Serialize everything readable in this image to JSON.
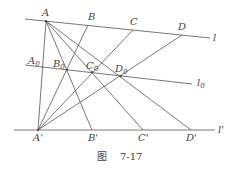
{
  "figure": {
    "caption_prefix": "图",
    "caption_number": "7-17",
    "lines": {
      "l": {
        "label": "l",
        "x1": 25,
        "y1": 19,
        "x2": 210,
        "y2": 38
      },
      "l0": {
        "label": "l",
        "sub": "0",
        "x1": 25,
        "y1": 65,
        "x2": 192,
        "y2": 84
      },
      "lp": {
        "label": "l'",
        "x1": 14,
        "y1": 130,
        "x2": 215,
        "y2": 130
      }
    },
    "points": {
      "A": {
        "label": "A",
        "sub": "",
        "x": 46,
        "y": 21
      },
      "B": {
        "label": "B",
        "sub": "",
        "x": 88,
        "y": 25
      },
      "C": {
        "label": "C",
        "sub": "",
        "x": 133,
        "y": 30
      },
      "D": {
        "label": "D",
        "sub": "",
        "x": 182,
        "y": 35
      },
      "A0": {
        "label": "A",
        "sub": "0",
        "x": 41,
        "y": 67
      },
      "B0": {
        "label": "B",
        "sub": "0",
        "x": 67,
        "y": 70
      },
      "C0": {
        "label": "C",
        "sub": "0",
        "x": 92,
        "y": 72
      },
      "D0": {
        "label": "D",
        "sub": "0",
        "x": 121,
        "y": 76
      },
      "Ap": {
        "label": "A'",
        "sub": "",
        "x": 38,
        "y": 130
      },
      "Bp": {
        "label": "B'",
        "sub": "",
        "x": 92,
        "y": 130
      },
      "Cp": {
        "label": "C'",
        "sub": "",
        "x": 143,
        "y": 130
      },
      "Dp": {
        "label": "D'",
        "sub": "",
        "x": 191,
        "y": 130
      }
    }
  }
}
